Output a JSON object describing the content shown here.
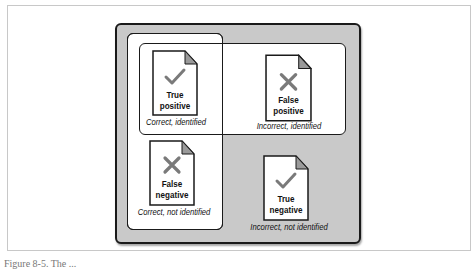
{
  "diagram": {
    "cells": [
      {
        "id": "true-positive",
        "title_line1": "True",
        "title_line2": "positive",
        "icon": "check-icon",
        "caption": "Correct, identified"
      },
      {
        "id": "false-positive",
        "title_line1": "False",
        "title_line2": "positive",
        "icon": "x-icon",
        "caption": "Incorrect, identified"
      },
      {
        "id": "false-negative",
        "title_line1": "False",
        "title_line2": "negative",
        "icon": "x-icon",
        "caption": "Correct, not identified"
      },
      {
        "id": "true-negative",
        "title_line1": "True",
        "title_line2": "negative",
        "icon": "check-icon",
        "caption": "Incorrect, not identified"
      }
    ],
    "groups": {
      "vertical": "Correct",
      "horizontal": "Identified"
    },
    "colors": {
      "outer_fill": "#c9c9c9",
      "inner_fill": "#ffffff",
      "border": "#1a1a1a",
      "icon_gray": "#7a7a7a",
      "fold_gray": "#9a9a9a"
    }
  },
  "figure_caption": "Figure 8-5. The ..."
}
